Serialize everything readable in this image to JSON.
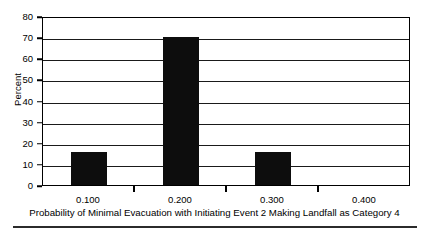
{
  "chart_data": {
    "type": "bar",
    "title": "",
    "subtitle": "",
    "xlabel": "Probability of Minimal Evacuation with Initiating Event 2 Making Landfall as Category 4",
    "ylabel": "Percent",
    "categories": [
      "0.100",
      "0.200",
      "0.300",
      "0.400"
    ],
    "values": [
      15.7,
      70.0,
      15.7,
      0
    ],
    "series": [
      {
        "name": "Percent",
        "values": [
          15.7,
          70.0,
          15.7,
          0
        ]
      }
    ],
    "x_tick_labels": [
      "0.100",
      "0.200",
      "0.300",
      "0.400"
    ],
    "y_tick_labels": [
      "0",
      "10",
      "20",
      "30",
      "40",
      "50",
      "60",
      "70",
      "80"
    ],
    "y_tick_values": [
      0,
      10,
      20,
      30,
      40,
      50,
      60,
      70,
      80
    ],
    "ylim": [
      0,
      80
    ],
    "xlim": [
      0.05,
      0.45
    ],
    "grid": "horizontal",
    "legend": "none",
    "bar_color": "#0d0d0d",
    "axis_color": "#000000",
    "background_color": "#ffffff",
    "annotations": []
  },
  "figure": {
    "caption_rule": true
  }
}
